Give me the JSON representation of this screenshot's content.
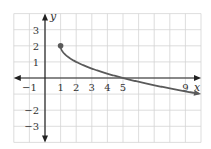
{
  "chart_data": {
    "type": "line",
    "title": "",
    "xlabel": "x",
    "ylabel": "y",
    "xlim": [
      -2,
      10
    ],
    "ylim": [
      -4,
      4
    ],
    "grid": true,
    "x_tick_labels": [
      "-1",
      "1",
      "2",
      "3",
      "4",
      "5",
      "9"
    ],
    "x_tick_values": [
      -1,
      1,
      2,
      3,
      4,
      5,
      9
    ],
    "y_tick_labels": [
      "3",
      "2",
      "1",
      "-2",
      "-3"
    ],
    "y_tick_values": [
      3,
      2,
      1,
      -2,
      -3
    ],
    "series": [
      {
        "name": "curve",
        "function": "y = 2 - sqrt(x - 1)",
        "x": [
          1,
          1.25,
          2,
          3,
          4,
          5,
          6,
          7,
          8,
          9,
          10
        ],
        "y": [
          2,
          1.5,
          1,
          0.59,
          0.27,
          0,
          -0.24,
          -0.45,
          -0.65,
          -0.83,
          -1
        ],
        "start_point": [
          1,
          2
        ],
        "start_point_filled": true,
        "end_arrow": true
      }
    ],
    "colors": {
      "curve": "#5a5a5a",
      "axis": "#222222",
      "grid": "#d4d4d4"
    }
  }
}
